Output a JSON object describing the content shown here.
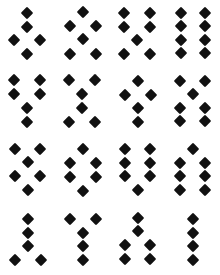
{
  "canvas": {
    "width": 220,
    "height": 275,
    "background_color": "#ffffff",
    "marker_color": "#111111",
    "marker_shape": "diamond",
    "marker_size": 9,
    "grid_rows": 4,
    "grid_cols": 4
  },
  "cells": [
    {
      "name": "cell-r1c1",
      "shape_label": "rhombus",
      "count": 5,
      "origin": [
        0,
        0
      ],
      "points": [
        [
          27,
          13
        ],
        [
          27,
          27
        ],
        [
          14,
          40
        ],
        [
          40,
          40
        ],
        [
          27,
          54
        ]
      ]
    },
    {
      "name": "cell-r1c2",
      "shape_label": "tree",
      "count": 6,
      "origin": [
        55,
        0
      ],
      "points": [
        [
          28,
          12
        ],
        [
          15,
          26
        ],
        [
          41,
          26
        ],
        [
          28,
          39
        ],
        [
          15,
          54
        ],
        [
          41,
          54
        ]
      ]
    },
    {
      "name": "cell-r1c3",
      "shape_label": "two-columns-with-center",
      "count": 7,
      "origin": [
        110,
        0
      ],
      "points": [
        [
          14,
          13
        ],
        [
          40,
          13
        ],
        [
          14,
          27
        ],
        [
          40,
          27
        ],
        [
          27,
          40
        ],
        [
          14,
          54
        ],
        [
          40,
          54
        ]
      ]
    },
    {
      "name": "cell-r1c4",
      "shape_label": "two-columns-of-four",
      "count": 8,
      "origin": [
        165,
        0
      ],
      "points": [
        [
          16,
          13
        ],
        [
          40,
          13
        ],
        [
          16,
          26
        ],
        [
          40,
          26
        ],
        [
          16,
          40
        ],
        [
          40,
          40
        ],
        [
          16,
          53
        ],
        [
          40,
          53
        ]
      ]
    },
    {
      "name": "cell-r2c1",
      "shape_label": "y-shape",
      "count": 6,
      "origin": [
        0,
        68
      ],
      "points": [
        [
          14,
          12
        ],
        [
          40,
          12
        ],
        [
          14,
          26
        ],
        [
          40,
          26
        ],
        [
          27,
          40
        ],
        [
          27,
          54
        ]
      ]
    },
    {
      "name": "cell-r2c2",
      "shape_label": "x-shape",
      "count": 6,
      "origin": [
        55,
        68
      ],
      "points": [
        [
          14,
          12
        ],
        [
          40,
          12
        ],
        [
          27,
          26
        ],
        [
          27,
          40
        ],
        [
          14,
          54
        ],
        [
          40,
          54
        ]
      ]
    },
    {
      "name": "cell-r2c3",
      "shape_label": "cross",
      "count": 5,
      "origin": [
        110,
        68
      ],
      "points": [
        [
          28,
          13
        ],
        [
          15,
          27
        ],
        [
          41,
          27
        ],
        [
          28,
          40
        ],
        [
          28,
          54
        ]
      ]
    },
    {
      "name": "cell-r2c4",
      "shape_label": "pair-over-block",
      "count": 7,
      "origin": [
        165,
        68
      ],
      "points": [
        [
          15,
          13
        ],
        [
          40,
          13
        ],
        [
          28,
          26
        ],
        [
          15,
          40
        ],
        [
          40,
          40
        ],
        [
          15,
          53
        ],
        [
          40,
          53
        ]
      ]
    },
    {
      "name": "cell-r3c1",
      "shape_label": "diamond-cluster",
      "count": 6,
      "origin": [
        0,
        137
      ],
      "points": [
        [
          15,
          12
        ],
        [
          40,
          12
        ],
        [
          28,
          25
        ],
        [
          15,
          39
        ],
        [
          40,
          39
        ],
        [
          28,
          53
        ]
      ]
    },
    {
      "name": "cell-r3c2",
      "shape_label": "hexagon-ring",
      "count": 6,
      "origin": [
        55,
        137
      ],
      "points": [
        [
          28,
          12
        ],
        [
          15,
          26
        ],
        [
          41,
          26
        ],
        [
          15,
          40
        ],
        [
          41,
          40
        ],
        [
          28,
          54
        ]
      ]
    },
    {
      "name": "cell-r3c3",
      "shape_label": "two-columns-with-tail",
      "count": 7,
      "origin": [
        110,
        137
      ],
      "points": [
        [
          15,
          12
        ],
        [
          40,
          12
        ],
        [
          15,
          26
        ],
        [
          40,
          26
        ],
        [
          15,
          39
        ],
        [
          40,
          39
        ],
        [
          28,
          53
        ]
      ]
    },
    {
      "name": "cell-r3c4",
      "shape_label": "head-over-two-columns",
      "count": 7,
      "origin": [
        165,
        137
      ],
      "points": [
        [
          28,
          12
        ],
        [
          15,
          26
        ],
        [
          40,
          26
        ],
        [
          15,
          39
        ],
        [
          40,
          39
        ],
        [
          15,
          53
        ],
        [
          40,
          53
        ]
      ]
    },
    {
      "name": "cell-r4c1",
      "shape_label": "stem-with-feet",
      "count": 5,
      "origin": [
        0,
        206
      ],
      "points": [
        [
          28,
          13
        ],
        [
          28,
          27
        ],
        [
          28,
          40
        ],
        [
          15,
          54
        ],
        [
          41,
          54
        ]
      ]
    },
    {
      "name": "cell-r4c2",
      "shape_label": "y-shape",
      "count": 5,
      "origin": [
        55,
        206
      ],
      "points": [
        [
          15,
          13
        ],
        [
          41,
          13
        ],
        [
          28,
          27
        ],
        [
          28,
          40
        ],
        [
          28,
          54
        ]
      ]
    },
    {
      "name": "cell-r4c3",
      "shape_label": "stem-over-block",
      "count": 6,
      "origin": [
        110,
        206
      ],
      "points": [
        [
          28,
          12
        ],
        [
          28,
          25
        ],
        [
          15,
          39
        ],
        [
          40,
          39
        ],
        [
          15,
          53
        ],
        [
          40,
          53
        ]
      ]
    },
    {
      "name": "cell-r4c4",
      "shape_label": "single-column-of-four",
      "count": 4,
      "origin": [
        165,
        206
      ],
      "points": [
        [
          28,
          13
        ],
        [
          28,
          27
        ],
        [
          28,
          40
        ],
        [
          28,
          54
        ]
      ]
    }
  ]
}
